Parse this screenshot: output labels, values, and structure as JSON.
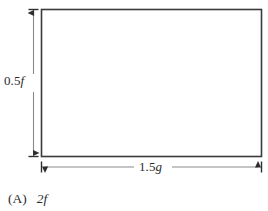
{
  "figure": {
    "name": "rectangle-with-dimensions",
    "background_color": "#ffffff",
    "stroke_color": "#3a3a3a",
    "shape": {
      "type": "rectangle",
      "x": 41,
      "y": 9,
      "width": 221,
      "height": 148,
      "fill": "none"
    },
    "dimensions": {
      "height": {
        "label_number": "0.5",
        "label_variable": "f",
        "label_full": "0.5f",
        "orientation": "vertical",
        "position": "left",
        "arrowheads": "both"
      },
      "width": {
        "label_number": "1.5",
        "label_variable": "g",
        "label_full": "1.5g",
        "orientation": "horizontal",
        "position": "bottom",
        "arrowheads": "both"
      }
    }
  },
  "answer_choice": {
    "tag": "(A)",
    "text": "2f",
    "coefficient": "2",
    "variable": "f"
  }
}
